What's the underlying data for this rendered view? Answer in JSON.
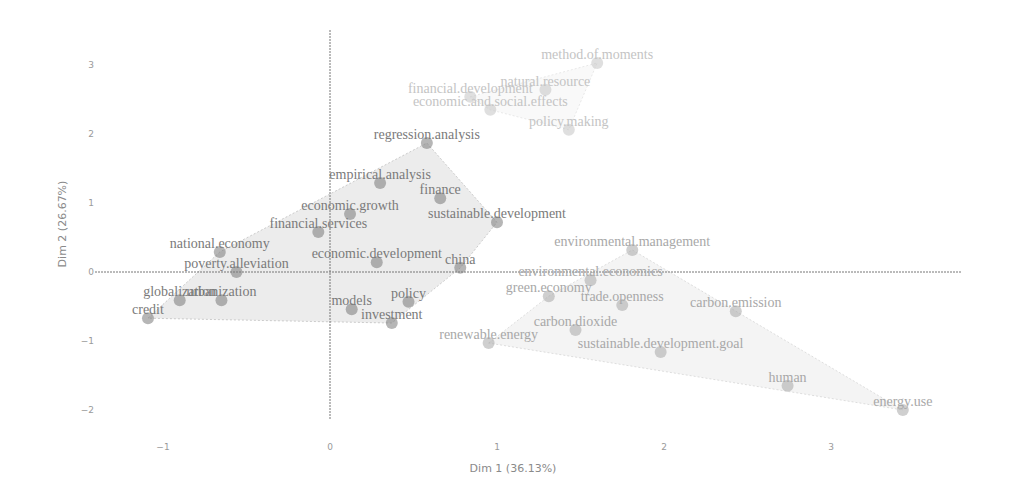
{
  "chart_data": {
    "type": "scatter",
    "title": "",
    "xlabel": "Dim 1 (36.13%)",
    "ylabel": "Dim 2 (26.67%)",
    "xlim": [
      -1.2,
      3.8
    ],
    "ylim": [
      -2.3,
      3.4
    ],
    "x_ticks": [
      -1,
      0,
      1,
      2,
      3
    ],
    "y_ticks": [
      -2,
      -1,
      0,
      1,
      2,
      3
    ],
    "grid": false,
    "legend": null,
    "clusters": [
      {
        "name": "cluster-1",
        "color": "#7a7a7a",
        "hull_color": "#e6e6e6",
        "points": [
          {
            "label": "credit",
            "x": -1.09,
            "y": -0.67
          },
          {
            "label": "globalization",
            "x": -0.9,
            "y": -0.41
          },
          {
            "label": "urbanization",
            "x": -0.65,
            "y": -0.41
          },
          {
            "label": "poverty.alleviation",
            "x": -0.56,
            "y": 0.0
          },
          {
            "label": "national.economy",
            "x": -0.66,
            "y": 0.29
          },
          {
            "label": "financial.services",
            "x": -0.07,
            "y": 0.58
          },
          {
            "label": "economic.growth",
            "x": 0.12,
            "y": 0.84
          },
          {
            "label": "empirical.analysis",
            "x": 0.3,
            "y": 1.29
          },
          {
            "label": "regression.analysis",
            "x": 0.58,
            "y": 1.87
          },
          {
            "label": "finance",
            "x": 0.66,
            "y": 1.07
          },
          {
            "label": "sustainable.development",
            "x": 1.0,
            "y": 0.72
          },
          {
            "label": "economic.development",
            "x": 0.28,
            "y": 0.14
          },
          {
            "label": "china",
            "x": 0.78,
            "y": 0.06
          },
          {
            "label": "models",
            "x": 0.13,
            "y": -0.54
          },
          {
            "label": "policy",
            "x": 0.47,
            "y": -0.43
          },
          {
            "label": "investment",
            "x": 0.37,
            "y": -0.74
          }
        ]
      },
      {
        "name": "cluster-2",
        "color": "#a8a8a8",
        "hull_color": "#f0f0f0",
        "points": [
          {
            "label": "environmental.management",
            "x": 1.81,
            "y": 0.32
          },
          {
            "label": "environmental.economics",
            "x": 1.56,
            "y": -0.12
          },
          {
            "label": "green.economy",
            "x": 1.31,
            "y": -0.35
          },
          {
            "label": "trade.openness",
            "x": 1.75,
            "y": -0.48
          },
          {
            "label": "carbon.dioxide",
            "x": 1.47,
            "y": -0.84
          },
          {
            "label": "renewable.energy",
            "x": 0.95,
            "y": -1.03
          },
          {
            "label": "sustainable.development.goal",
            "x": 1.98,
            "y": -1.16
          },
          {
            "label": "carbon.emission",
            "x": 2.43,
            "y": -0.57
          },
          {
            "label": "human",
            "x": 2.74,
            "y": -1.65
          },
          {
            "label": "energy.use",
            "x": 3.43,
            "y": -2.0
          }
        ]
      },
      {
        "name": "cluster-3",
        "color": "#c4c4c4",
        "hull_color": "#f7f7f7",
        "points": [
          {
            "label": "method.of.moments",
            "x": 1.6,
            "y": 3.03
          },
          {
            "label": "financial.development",
            "x": 0.84,
            "y": 2.54
          },
          {
            "label": "natural.resource",
            "x": 1.29,
            "y": 2.64
          },
          {
            "label": "economic.and.social.effects",
            "x": 0.96,
            "y": 2.35
          },
          {
            "label": "policy.making",
            "x": 1.43,
            "y": 2.06
          }
        ]
      }
    ]
  },
  "labels": {
    "xlabel": "Dim 1 (36.13%)",
    "ylabel": "Dim 2 (26.67%)"
  },
  "layout": {
    "x0_px": 330,
    "px_per_x": 167,
    "y0_px": 272,
    "px_per_y": 69
  }
}
